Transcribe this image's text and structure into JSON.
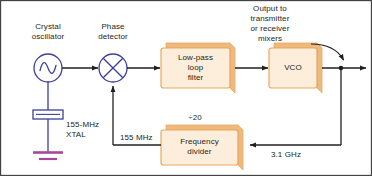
{
  "figure": {
    "background": "#ffffff",
    "frame_color": "#3a3a3a",
    "line_color": "#231f20",
    "box_fill": "#fdeedb",
    "box_edge": "#e8a863",
    "box_shadow": "#efb97e",
    "symbol_color": "#3b3f9e",
    "ground_color": "#a4489b"
  },
  "labels": {
    "crystal_oscillator": "Crystal\noscillator",
    "phase_detector": "Phase\ndetector",
    "output_note": "Output to\ntransmitter\nor receiver\nmixers",
    "xtal": "155-MHz\nXTAL",
    "feedback_freq": "155 MHz",
    "divide_ratio": "÷20",
    "vco_out_freq": "3.1 GHz"
  },
  "blocks": [
    {
      "id": "low-pass-loop-filter",
      "label": "Low-pass\nloop\nfilter"
    },
    {
      "id": "vco",
      "label": "VCO"
    },
    {
      "id": "frequency-divider",
      "label": "Frequency\ndivider"
    }
  ],
  "symbols": [
    {
      "id": "oscillator",
      "kind": "sine-circle"
    },
    {
      "id": "mixer",
      "kind": "x-circle"
    },
    {
      "id": "crystal",
      "kind": "xtal"
    },
    {
      "id": "ground",
      "kind": "ground"
    }
  ],
  "signal_flow": {
    "oscillator_to_phase_detector": "155 MHz",
    "phase_detector_to_filter": "",
    "filter_to_vco": "",
    "vco_to_output": "3.1 GHz",
    "vco_to_divider": "3.1 GHz",
    "divider_to_phase_detector": "155 MHz"
  }
}
